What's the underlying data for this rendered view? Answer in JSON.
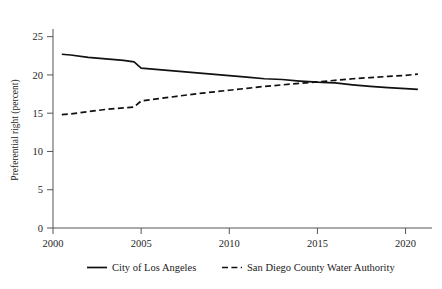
{
  "chart_data": {
    "type": "line",
    "title": "",
    "xlabel": "",
    "ylabel": "Preferential right (percent)",
    "xlim": [
      2000,
      2021.5
    ],
    "ylim": [
      0,
      26
    ],
    "grid": false,
    "legend_position": "bottom",
    "xticks": [
      2000,
      2005,
      2010,
      2015,
      2020
    ],
    "xtick_labels": [
      "2000",
      "2005",
      "2010",
      "2015",
      "2020"
    ],
    "yticks": [
      0,
      5,
      10,
      15,
      20,
      25
    ],
    "ytick_labels": [
      "0",
      "5",
      "10",
      "15",
      "20",
      "25"
    ],
    "x": [
      2000.5,
      2001,
      2002,
      2003,
      2004,
      2004.6,
      2005,
      2006,
      2007,
      2008,
      2009,
      2010,
      2011,
      2012,
      2013,
      2014,
      2015,
      2015.6,
      2016,
      2017,
      2018,
      2019,
      2020,
      2020.7
    ],
    "series": [
      {
        "name": "City of Los Angeles",
        "style": "solid",
        "color": "#111111",
        "values": [
          22.7,
          22.6,
          22.3,
          22.1,
          21.9,
          21.7,
          20.9,
          20.7,
          20.5,
          20.3,
          20.1,
          19.9,
          19.7,
          19.5,
          19.4,
          19.2,
          19.05,
          19.0,
          18.95,
          18.7,
          18.5,
          18.35,
          18.2,
          18.1
        ]
      },
      {
        "name": "San Diego County Water Authority",
        "style": "dashed",
        "color": "#111111",
        "values": [
          14.8,
          14.9,
          15.2,
          15.5,
          15.7,
          15.8,
          16.6,
          16.9,
          17.2,
          17.5,
          17.75,
          18.0,
          18.25,
          18.5,
          18.7,
          18.9,
          19.1,
          19.2,
          19.3,
          19.5,
          19.65,
          19.8,
          19.95,
          20.1
        ]
      }
    ]
  },
  "legend": {
    "items": [
      {
        "label": "City of Los Angeles",
        "style": "solid"
      },
      {
        "label": "San Diego County Water Authority",
        "style": "dashed"
      }
    ]
  }
}
